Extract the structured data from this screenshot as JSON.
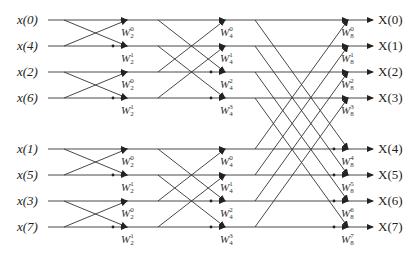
{
  "diagram": {
    "inputs": [
      "x(0)",
      "x(4)",
      "x(2)",
      "x(6)",
      "x(1)",
      "x(5)",
      "x(3)",
      "x(7)"
    ],
    "outputs": [
      "X(0)",
      "X(1)",
      "X(2)",
      "X(3)",
      "X(4)",
      "X(5)",
      "X(6)",
      "X(7)"
    ],
    "row_y": [
      20,
      46,
      72,
      98,
      149,
      175,
      201,
      227
    ],
    "stages": [
      {
        "name": "stage-1",
        "twiddles": [
          {
            "base": "W",
            "sub": "2",
            "sup": "0",
            "row": 0
          },
          {
            "base": "W",
            "sub": "2",
            "sup": "1",
            "row": 1
          },
          {
            "base": "W",
            "sub": "2",
            "sup": "0",
            "row": 2
          },
          {
            "base": "W",
            "sub": "2",
            "sup": "1",
            "row": 3
          },
          {
            "base": "W",
            "sub": "2",
            "sup": "0",
            "row": 4
          },
          {
            "base": "W",
            "sub": "2",
            "sup": "1",
            "row": 5
          },
          {
            "base": "W",
            "sub": "2",
            "sup": "0",
            "row": 6
          },
          {
            "base": "W",
            "sub": "2",
            "sup": "1",
            "row": 7
          }
        ]
      },
      {
        "name": "stage-2",
        "twiddles": [
          {
            "base": "W",
            "sub": "4",
            "sup": "0",
            "row": 0
          },
          {
            "base": "W",
            "sub": "4",
            "sup": "1",
            "row": 1
          },
          {
            "base": "W",
            "sub": "4",
            "sup": "2",
            "row": 2
          },
          {
            "base": "W",
            "sub": "4",
            "sup": "3",
            "row": 3
          },
          {
            "base": "W",
            "sub": "4",
            "sup": "0",
            "row": 4
          },
          {
            "base": "W",
            "sub": "4",
            "sup": "1",
            "row": 5
          },
          {
            "base": "W",
            "sub": "4",
            "sup": "2",
            "row": 6
          },
          {
            "base": "W",
            "sub": "4",
            "sup": "3",
            "row": 7
          }
        ]
      },
      {
        "name": "stage-3",
        "twiddles": [
          {
            "base": "W",
            "sub": "8",
            "sup": "0",
            "row": 0
          },
          {
            "base": "W",
            "sub": "8",
            "sup": "1",
            "row": 1
          },
          {
            "base": "W",
            "sub": "8",
            "sup": "2",
            "row": 2
          },
          {
            "base": "W",
            "sub": "8",
            "sup": "3",
            "row": 3
          },
          {
            "base": "W",
            "sub": "8",
            "sup": "4",
            "row": 4
          },
          {
            "base": "W",
            "sub": "8",
            "sup": "5",
            "row": 5
          },
          {
            "base": "W",
            "sub": "8",
            "sup": "6",
            "row": 6
          },
          {
            "base": "W",
            "sub": "8",
            "sup": "7",
            "row": 7
          }
        ]
      }
    ],
    "colors": {
      "line": "#333333",
      "text": "#222222"
    }
  }
}
